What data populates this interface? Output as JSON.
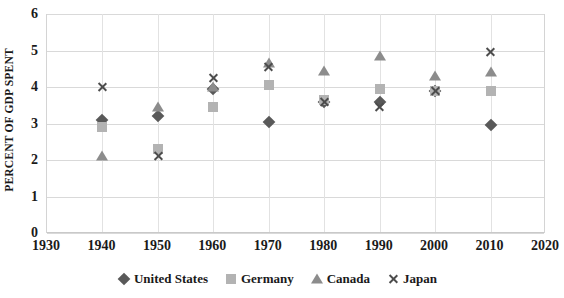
{
  "chart_data": {
    "type": "scatter",
    "title": "",
    "xlabel": "",
    "ylabel": "PERCENT OF GDP SPENT",
    "xlim": [
      1930,
      2020
    ],
    "ylim": [
      0,
      6
    ],
    "x_ticks": [
      1930,
      1940,
      1950,
      1960,
      1970,
      1980,
      1990,
      2000,
      2010,
      2020
    ],
    "y_ticks": [
      0,
      1,
      2,
      3,
      4,
      5,
      6
    ],
    "grid": true,
    "legend_position": "bottom",
    "x": [
      1940,
      1950,
      1960,
      1970,
      1980,
      1990,
      2000,
      2010
    ],
    "series": [
      {
        "name": "United States",
        "marker": "diamond",
        "color": "#595959",
        "values": [
          3.1,
          3.2,
          3.95,
          3.05,
          3.6,
          3.6,
          3.9,
          2.95
        ]
      },
      {
        "name": "Germany",
        "marker": "square",
        "color": "#b3b3b3",
        "values": [
          2.9,
          2.3,
          3.45,
          4.05,
          3.65,
          3.95,
          3.9,
          3.9
        ]
      },
      {
        "name": "Canada",
        "marker": "triangle",
        "color": "#8c8c8c",
        "values": [
          2.1,
          3.45,
          4.0,
          4.65,
          4.45,
          4.85,
          4.3,
          4.4
        ]
      },
      {
        "name": "Japan",
        "marker": "cross",
        "color": "#4d4d4d",
        "values": [
          4.0,
          2.1,
          4.25,
          4.55,
          3.6,
          3.45,
          3.9,
          4.95
        ]
      }
    ]
  }
}
